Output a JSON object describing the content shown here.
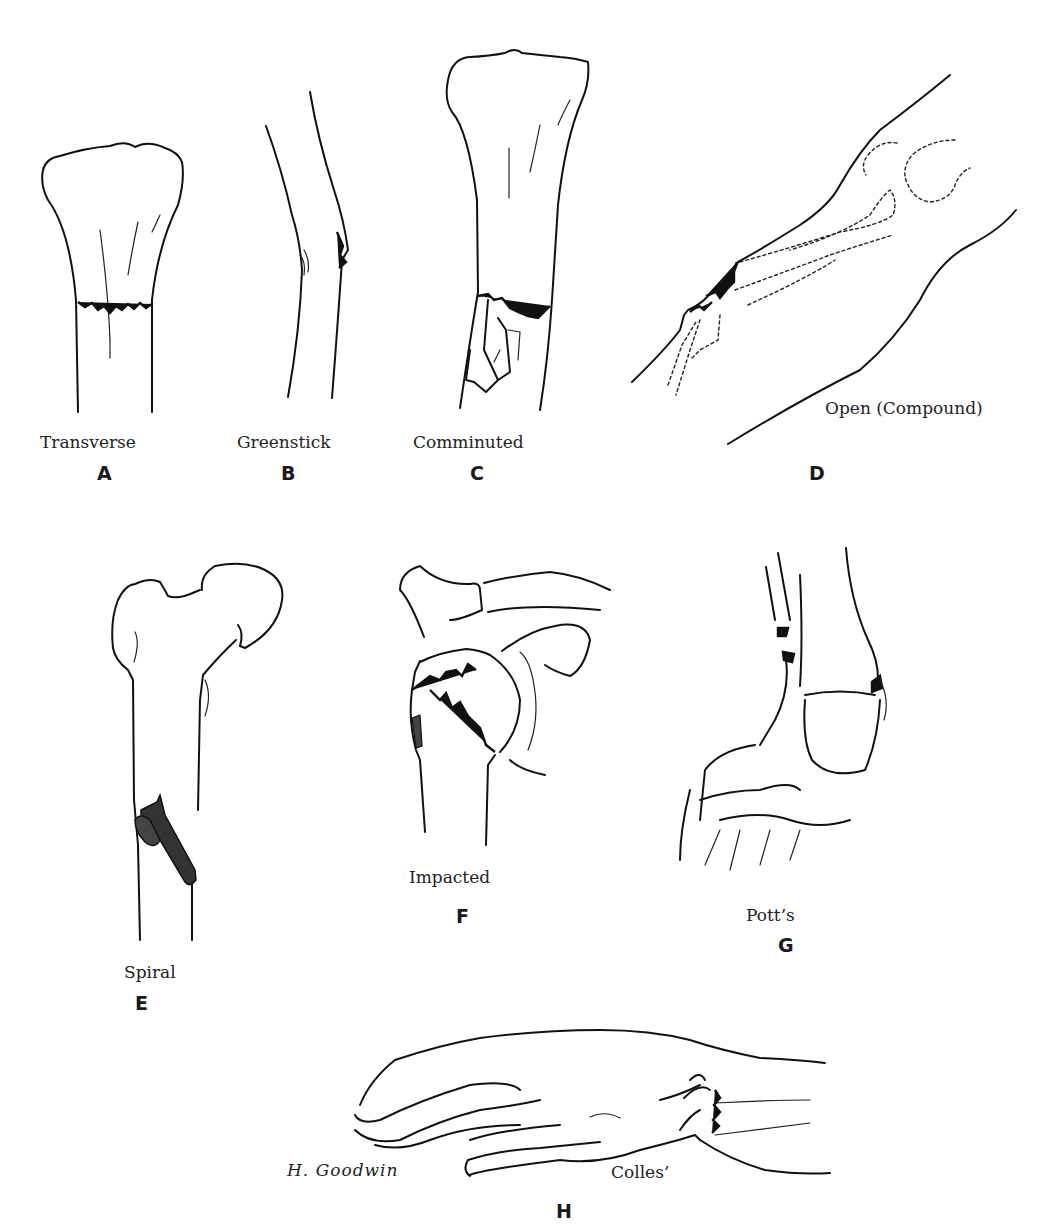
{
  "plate": {
    "subject": "Types of bone fractures",
    "figures": [
      {
        "letter": "A",
        "label": "Transverse"
      },
      {
        "letter": "B",
        "label": "Greenstick"
      },
      {
        "letter": "C",
        "label": "Comminuted"
      },
      {
        "letter": "D",
        "label": "Open (Compound)"
      },
      {
        "letter": "E",
        "label": "Spiral"
      },
      {
        "letter": "F",
        "label": "Impacted"
      },
      {
        "letter": "G",
        "label": "Pott’s"
      },
      {
        "letter": "H",
        "label": "Colles’"
      }
    ],
    "signature": "H. Goodwin",
    "colors": {
      "ink": "#111111",
      "background": "#ffffff"
    }
  }
}
